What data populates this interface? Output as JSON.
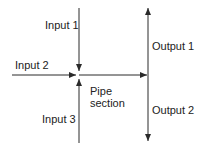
{
  "diagram": {
    "labels": {
      "input1": "Input 1",
      "input2": "Input 2",
      "input3": "Input 3",
      "output1": "Output 1",
      "output2": "Output 2",
      "pipe_line1": "Pipe",
      "pipe_line2": "section"
    },
    "colors": {
      "line": "#2a2a2a",
      "background": "#ffffff"
    }
  }
}
